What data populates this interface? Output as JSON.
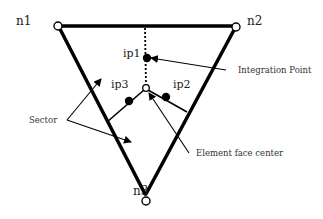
{
  "diagram": {
    "type": "triangular element face with integration points",
    "nodes": [
      {
        "id": "n1",
        "label": "n1",
        "x": 58,
        "y": 26
      },
      {
        "id": "n2",
        "label": "n2",
        "x": 236,
        "y": 27
      },
      {
        "id": "n3",
        "label": "n3",
        "x": 146,
        "y": 201
      }
    ],
    "face_center": {
      "x": 146,
      "y": 88
    },
    "integration_points": [
      {
        "id": "ip1",
        "label": "ip1",
        "x": 147,
        "y": 58
      },
      {
        "id": "ip2",
        "label": "ip2",
        "x": 166,
        "y": 97
      },
      {
        "id": "ip3",
        "label": "ip3",
        "x": 129,
        "y": 101
      }
    ],
    "callouts": {
      "integration_point": "Integration Point",
      "face_center": "Element face center",
      "sector": "Sector"
    },
    "colors": {
      "stroke": "#000000",
      "text": "#222222",
      "background": "#ffffff"
    }
  }
}
